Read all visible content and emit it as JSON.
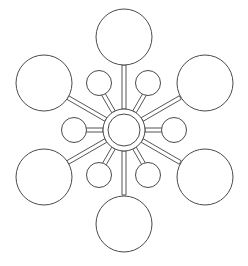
{
  "diagram": {
    "type": "radial-hub-and-spoke",
    "canvas": {
      "width": 248,
      "height": 266,
      "background": "#ffffff"
    },
    "style": {
      "stroke_color": "#4a4a4a",
      "stroke_width": 1,
      "fill_color": "#ffffff",
      "spoke_stroke_color": "#555555",
      "spoke_stroke_width": 1,
      "spoke_width": 4
    },
    "hub": {
      "label": "",
      "center_x": 124,
      "center_y": 130,
      "outer_radius": 21,
      "inner_radius": 16
    },
    "ring_counts": {
      "large_nodes": 6,
      "small_nodes": 6,
      "spokes": 12
    },
    "large_nodes": [
      {
        "id": "large-top",
        "label": "",
        "angle_deg": -90,
        "cx": 124,
        "cy": 37,
        "r": 28
      },
      {
        "id": "large-upper-right",
        "label": "",
        "angle_deg": -30,
        "cx": 205,
        "cy": 83,
        "r": 28
      },
      {
        "id": "large-lower-right",
        "label": "",
        "angle_deg": 30,
        "cx": 205,
        "cy": 177,
        "r": 28
      },
      {
        "id": "large-bottom",
        "label": "",
        "angle_deg": 90,
        "cx": 124,
        "cy": 224,
        "r": 28
      },
      {
        "id": "large-lower-left",
        "label": "",
        "angle_deg": 150,
        "cx": 44,
        "cy": 177,
        "r": 28
      },
      {
        "id": "large-upper-left",
        "label": "",
        "angle_deg": -150,
        "cx": 44,
        "cy": 83,
        "r": 28
      }
    ],
    "small_nodes": [
      {
        "id": "small-upper-right",
        "label": "",
        "angle_deg": -60,
        "cx": 148,
        "cy": 83,
        "r": 12.5
      },
      {
        "id": "small-right",
        "label": "",
        "angle_deg": 0,
        "cx": 174,
        "cy": 130,
        "r": 12.5
      },
      {
        "id": "small-lower-right",
        "label": "",
        "angle_deg": 60,
        "cx": 148,
        "cy": 175,
        "r": 12.5
      },
      {
        "id": "small-lower-left",
        "label": "",
        "angle_deg": 120,
        "cx": 99,
        "cy": 175,
        "r": 12.5
      },
      {
        "id": "small-left",
        "label": "",
        "angle_deg": 180,
        "cx": 74,
        "cy": 130,
        "r": 12.5
      },
      {
        "id": "small-upper-left",
        "label": "",
        "angle_deg": -120,
        "cx": 99,
        "cy": 83,
        "r": 12.5
      }
    ],
    "spokes": [
      {
        "id": "spoke-to-large-top",
        "angle_deg": -90,
        "inner_radius": 21,
        "outer_radius": 65,
        "half_width": 2
      },
      {
        "id": "spoke-to-small-upper-right",
        "angle_deg": -60,
        "inner_radius": 21,
        "outer_radius": 42,
        "half_width": 2
      },
      {
        "id": "spoke-to-large-upper-right",
        "angle_deg": -30,
        "inner_radius": 21,
        "outer_radius": 65,
        "half_width": 2
      },
      {
        "id": "spoke-to-small-right",
        "angle_deg": 0,
        "inner_radius": 21,
        "outer_radius": 42,
        "half_width": 2
      },
      {
        "id": "spoke-to-large-lower-right",
        "angle_deg": 30,
        "inner_radius": 21,
        "outer_radius": 65,
        "half_width": 2
      },
      {
        "id": "spoke-to-small-lower-right",
        "angle_deg": 60,
        "inner_radius": 21,
        "outer_radius": 42,
        "half_width": 2
      },
      {
        "id": "spoke-to-large-bottom",
        "angle_deg": 90,
        "inner_radius": 21,
        "outer_radius": 65,
        "half_width": 2
      },
      {
        "id": "spoke-to-small-lower-left",
        "angle_deg": 120,
        "inner_radius": 21,
        "outer_radius": 42,
        "half_width": 2
      },
      {
        "id": "spoke-to-large-lower-left",
        "angle_deg": 150,
        "inner_radius": 21,
        "outer_radius": 65,
        "half_width": 2
      },
      {
        "id": "spoke-to-small-left",
        "angle_deg": 180,
        "inner_radius": 21,
        "outer_radius": 42,
        "half_width": 2
      },
      {
        "id": "spoke-to-large-upper-left",
        "angle_deg": -150,
        "inner_radius": 21,
        "outer_radius": 65,
        "half_width": 2
      },
      {
        "id": "spoke-to-small-upper-left",
        "angle_deg": -120,
        "inner_radius": 21,
        "outer_radius": 42,
        "half_width": 2
      }
    ]
  }
}
